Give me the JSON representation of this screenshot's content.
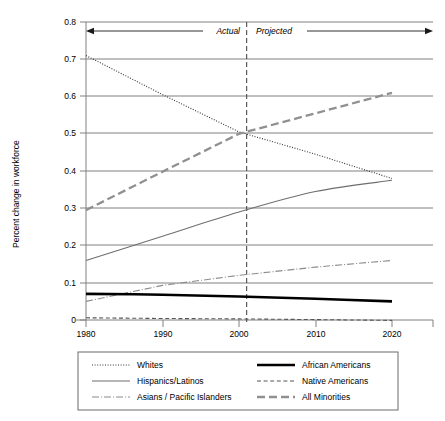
{
  "chart_data": {
    "type": "line",
    "title": "",
    "xlabel": "",
    "ylabel": "Percent change in workforce",
    "xlim": [
      1976,
      2024
    ],
    "ylim": [
      0,
      0.8
    ],
    "x_ticks": [
      1980,
      1990,
      2000,
      2010,
      2020
    ],
    "y_ticks": [
      "0",
      "0.1",
      "0.2",
      "0.3",
      "0.4",
      "0.5",
      "0.6",
      "0.7",
      "0.8"
    ],
    "y_tick_values": [
      0,
      0.1,
      0.2,
      0.3,
      0.4,
      0.5,
      0.6,
      0.7,
      0.8
    ],
    "grid": true,
    "legend_position": "below",
    "x": [
      1980,
      1990,
      2000,
      2010,
      2020
    ],
    "series": [
      {
        "name": "Whites",
        "style": "dotted",
        "color": "#333333",
        "values": [
          0.71,
          0.605,
          0.505,
          0.445,
          0.38
        ]
      },
      {
        "name": "Hispanics/Latinos",
        "style": "solid-thin",
        "color": "#6e6e6e",
        "values": [
          0.16,
          0.225,
          0.29,
          0.345,
          0.375
        ]
      },
      {
        "name": "Asians / Pacific Islanders",
        "style": "dash-dot",
        "color": "#8c8c8c",
        "values": [
          0.05,
          0.093,
          0.12,
          0.142,
          0.16
        ]
      },
      {
        "name": "African Americans",
        "style": "solid-thick",
        "color": "#000000",
        "values": [
          0.07,
          0.068,
          0.063,
          0.057,
          0.05
        ]
      },
      {
        "name": "Native Americans",
        "style": "dashed-thin",
        "color": "#555555",
        "values": [
          0.006,
          0.004,
          0.003,
          0.001,
          -0.001
        ]
      },
      {
        "name": "All Minorities",
        "style": "dashed-thick",
        "color": "#909090",
        "values": [
          0.295,
          0.398,
          0.5,
          0.555,
          0.61
        ]
      }
    ],
    "annotations": {
      "actual_label": "Actual",
      "projected_label": "Projected",
      "divider_year": 2001,
      "arrow_level": 0.765
    }
  },
  "legend": {
    "entries": [
      {
        "label": "Whites",
        "key": "whites"
      },
      {
        "label": "African Americans",
        "key": "african-americans"
      },
      {
        "label": "Hispanics/Latinos",
        "key": "hispanics-latinos"
      },
      {
        "label": "Native Americans",
        "key": "native-americans"
      },
      {
        "label": "Asians / Pacific Islanders",
        "key": "asians-pacific-islanders"
      },
      {
        "label": "All Minorities",
        "key": "all-minorities"
      }
    ]
  }
}
